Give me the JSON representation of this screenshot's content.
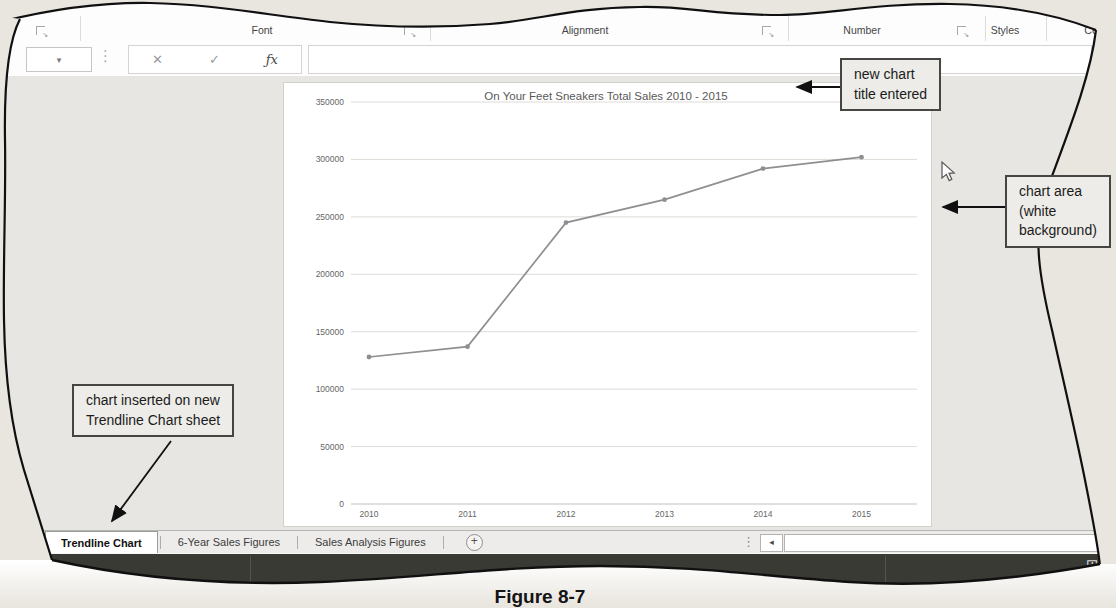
{
  "page": {
    "caption": "Figure 8-7"
  },
  "ribbon": {
    "groups": [
      "Font",
      "Alignment",
      "Number",
      "Styles",
      "Cells"
    ]
  },
  "formula_bar": {
    "name_box_value": "",
    "formula_value": ""
  },
  "icons": {
    "dropdown_arrow": "▾",
    "cancel": "✕",
    "enter": "✓",
    "insert_function": "ƒx",
    "vertical_dots": "⋮",
    "launcher_arrow": "↘",
    "add_sheet": "+",
    "scroll_left": "◂",
    "grid_view": "⊞"
  },
  "callouts": {
    "title_note": {
      "lines": [
        "new chart",
        "title entered"
      ]
    },
    "chart_area_note": {
      "lines": [
        "chart area",
        "(white",
        "background)"
      ]
    },
    "sheet_note": {
      "lines": [
        "chart inserted on new",
        "Trendline Chart sheet"
      ]
    }
  },
  "sheet_tabs": {
    "tabs": [
      {
        "label": "Trendline Chart",
        "active": true
      },
      {
        "label": "6-Year Sales Figures",
        "active": false
      },
      {
        "label": "Sales Analysis Figures",
        "active": false
      }
    ]
  },
  "colors": {
    "chart_line": "#8f8f8f",
    "status_bar": "#3a3a35"
  },
  "chart_data": {
    "type": "line",
    "title": "On Your Feet Sneakers Total Sales 2010 - 2015",
    "categories": [
      "2010",
      "2011",
      "2012",
      "2013",
      "2014",
      "2015"
    ],
    "series": [
      {
        "name": "Total Sales",
        "values": [
          128000,
          137000,
          245000,
          265000,
          292000,
          302000
        ]
      }
    ],
    "xlabel": "",
    "ylabel": "",
    "ylim": [
      0,
      350000
    ],
    "yticks": [
      0,
      50000,
      100000,
      150000,
      200000,
      250000,
      300000,
      350000
    ],
    "grid": true,
    "legend": "none",
    "line_color": "#8f8f8f"
  }
}
